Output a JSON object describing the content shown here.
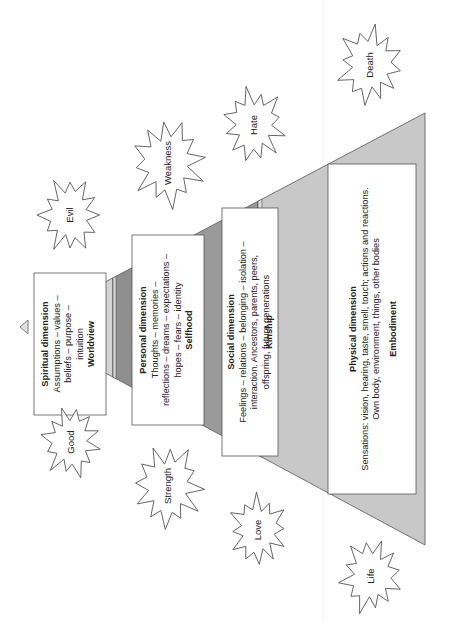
{
  "diagram": {
    "orientation": "rotated-90-counterclockwise",
    "levels": [
      {
        "id": "spiritual",
        "title": "Spiritual dimension",
        "lines": [
          "Assumptions – values –",
          "beliefs – purpose –",
          "intuition"
        ],
        "keyword": "Worldview",
        "band_color": "#d3d3d3"
      },
      {
        "id": "personal",
        "title": "Personal dimension",
        "lines": [
          "Thoughts – memories –",
          "reflections – dreams – expectations –",
          "hopes – fears – identity"
        ],
        "keyword": "Selfhood",
        "band_color": "#8f8f8f"
      },
      {
        "id": "social",
        "title": "Social dimension",
        "lines": [
          "Feelings – relations – belonging – isolation –",
          "interaction. Ancestors, parents, peers,",
          "offspring, future generations"
        ],
        "keyword": "Kinship",
        "band_color": "#9a9a9a"
      },
      {
        "id": "physical",
        "title": "Physical dimension",
        "lines": [
          "Sensations: vision, hearing, taste, smell, touch; actions and reactions.",
          "Own body, environment, things, other bodies"
        ],
        "keyword": "Embodiment",
        "band_color": "#c8c8c8"
      }
    ],
    "polarities": {
      "negative": [
        "Evil",
        "Weakness",
        "Hate",
        "Death"
      ],
      "positive": [
        "Good",
        "Strength",
        "Love",
        "Life"
      ]
    },
    "colors": {
      "outline": "#555555",
      "box_fill": "#ffffff",
      "text": "#222222"
    }
  }
}
